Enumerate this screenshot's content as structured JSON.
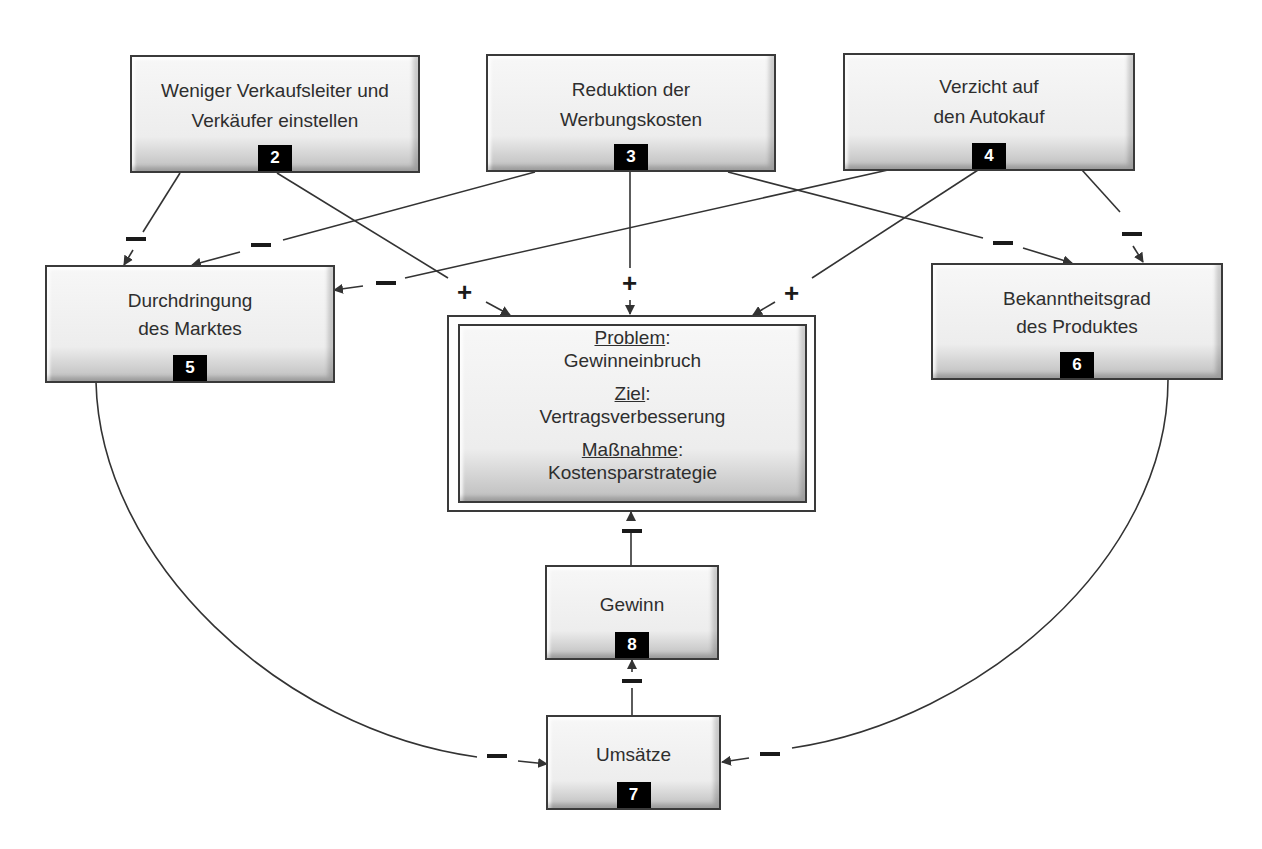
{
  "diagram": {
    "nodes": [
      {
        "id": "2",
        "label_line1": "Weniger Verkaufsleiter und",
        "label_line2": "Verkäufer einstellen",
        "badge": "2"
      },
      {
        "id": "3",
        "label_line1": "Reduktion der",
        "label_line2": "Werbungskosten",
        "badge": "3"
      },
      {
        "id": "4",
        "label_line1": "Verzicht auf",
        "label_line2": "den Autokauf",
        "badge": "4"
      },
      {
        "id": "5",
        "label_line1": "Durchdringung",
        "label_line2": "des Marktes",
        "badge": "5"
      },
      {
        "id": "6",
        "label_line1": "Bekanntheitsgrad",
        "label_line2": "des Produktes",
        "badge": "6"
      },
      {
        "id": "7",
        "label_line1": "Umsätze",
        "badge": "7"
      },
      {
        "id": "8",
        "label_line1": "Gewinn",
        "badge": "8"
      }
    ],
    "central": {
      "problem_label": "Problem",
      "problem_value": "Gewinneinbruch",
      "goal_label": "Ziel",
      "goal_value": "Vertragsverbesserung",
      "measure_label": "Maßnahme",
      "measure_value": "Kostensparstrategie",
      "colon": ":"
    },
    "edges": [
      {
        "from": "2",
        "to": "5",
        "sign": "−"
      },
      {
        "from": "2",
        "to": "central",
        "sign": "+"
      },
      {
        "from": "3",
        "to": "5",
        "sign": "−"
      },
      {
        "from": "3",
        "to": "central",
        "sign": "+"
      },
      {
        "from": "3",
        "to": "6",
        "sign": "−"
      },
      {
        "from": "4",
        "to": "5",
        "sign": "−"
      },
      {
        "from": "4",
        "to": "central",
        "sign": "+"
      },
      {
        "from": "4",
        "to": "6",
        "sign": "−"
      },
      {
        "from": "5",
        "to": "7",
        "sign": "−"
      },
      {
        "from": "6",
        "to": "7",
        "sign": "−"
      },
      {
        "from": "7",
        "to": "8",
        "sign": "−"
      },
      {
        "from": "8",
        "to": "central",
        "sign": "−"
      }
    ],
    "signs": {
      "plus": "+",
      "minus": "−"
    }
  }
}
